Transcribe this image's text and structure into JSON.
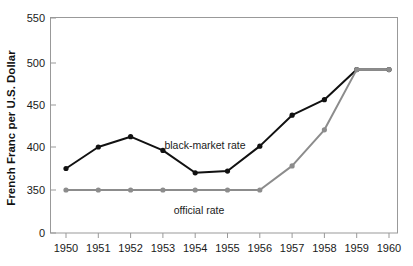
{
  "chart_data": {
    "type": "line",
    "title": "",
    "xlabel": "",
    "ylabel": "French Franc per U.S. Dollar",
    "x": [
      1950,
      1951,
      1952,
      1953,
      1954,
      1955,
      1956,
      1957,
      1958,
      1959,
      1960
    ],
    "xtick_labels": [
      "1950",
      "1951",
      "1952",
      "1953",
      "1954",
      "1955",
      "1956",
      "1957",
      "1958",
      "1959",
      "1960"
    ],
    "ytick_labels": [
      "0",
      "350",
      "400",
      "450",
      "500",
      "550"
    ],
    "ytick_values": [
      0,
      350,
      400,
      450,
      500,
      550
    ],
    "ylim": [
      350,
      550
    ],
    "y_axis_break": true,
    "grid": false,
    "legend": "inline-annotations",
    "series": [
      {
        "name": "black-market rate",
        "color": "#111111",
        "marker": "circle",
        "values": [
          375,
          400,
          412,
          396,
          370,
          372,
          401,
          437,
          455,
          490,
          490
        ]
      },
      {
        "name": "official rate",
        "color": "#8c8c8c",
        "marker": "circle",
        "values": [
          350,
          350,
          350,
          350,
          350,
          350,
          350,
          378,
          420,
          490,
          490
        ]
      }
    ],
    "annotations": [
      {
        "text": "black-market rate",
        "x": 1954.1,
        "y": 385
      },
      {
        "text": "official rate",
        "x": 1954.2,
        "y": 339
      }
    ]
  },
  "axis": {
    "y_label": "French Franc per U.S. Dollar",
    "y_ticks": [
      "550",
      "500",
      "450",
      "400",
      "350",
      "0"
    ],
    "x_ticks": [
      "1950",
      "1951",
      "1952",
      "1953",
      "1954",
      "1955",
      "1956",
      "1957",
      "1958",
      "1959",
      "1960"
    ]
  },
  "labels": {
    "black_market": "black-market rate",
    "official": "official rate"
  },
  "colors": {
    "black_series": "#111111",
    "gray_series": "#8c8c8c",
    "frame": "#999999",
    "text": "#1a1a1a",
    "background": "#ffffff"
  }
}
